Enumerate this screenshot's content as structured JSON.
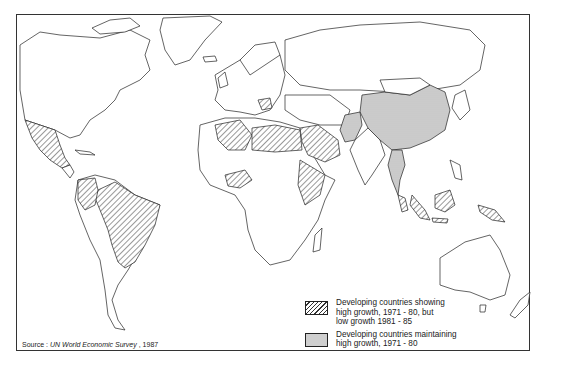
{
  "map": {
    "title": "",
    "projection": "world",
    "legend": [
      {
        "pattern": "hatched",
        "label": "Developing countries showing high growth, 1971 - 80, but low growth 1981 - 85",
        "lines": [
          "Developing countries showing",
          "high growth, 1971 - 80, but",
          "low growth 1981 - 85"
        ]
      },
      {
        "pattern": "stippled",
        "label": "Developing countries maintaining high growth, 1971 - 80",
        "lines": [
          "Developing countries maintaining",
          "high growth, 1971 - 80"
        ]
      }
    ],
    "source": {
      "prefix": "Source : ",
      "title": "UN World Economic Survey",
      "suffix": " , 1987"
    },
    "regions": {
      "hatched": [
        "Mexico",
        "Brazil",
        "Colombia",
        "Peru",
        "Paraguay",
        "Algeria",
        "Libya",
        "Egypt",
        "Saudi Arabia",
        "Iraq",
        "Syria",
        "Nigeria",
        "Kenya",
        "Ethiopia",
        "Indonesia",
        "Malaysia",
        "Philippines",
        "Papua New Guinea",
        "Yugoslavia"
      ],
      "stippled": [
        "China",
        "Pakistan",
        "Thailand",
        "Burma"
      ]
    }
  }
}
